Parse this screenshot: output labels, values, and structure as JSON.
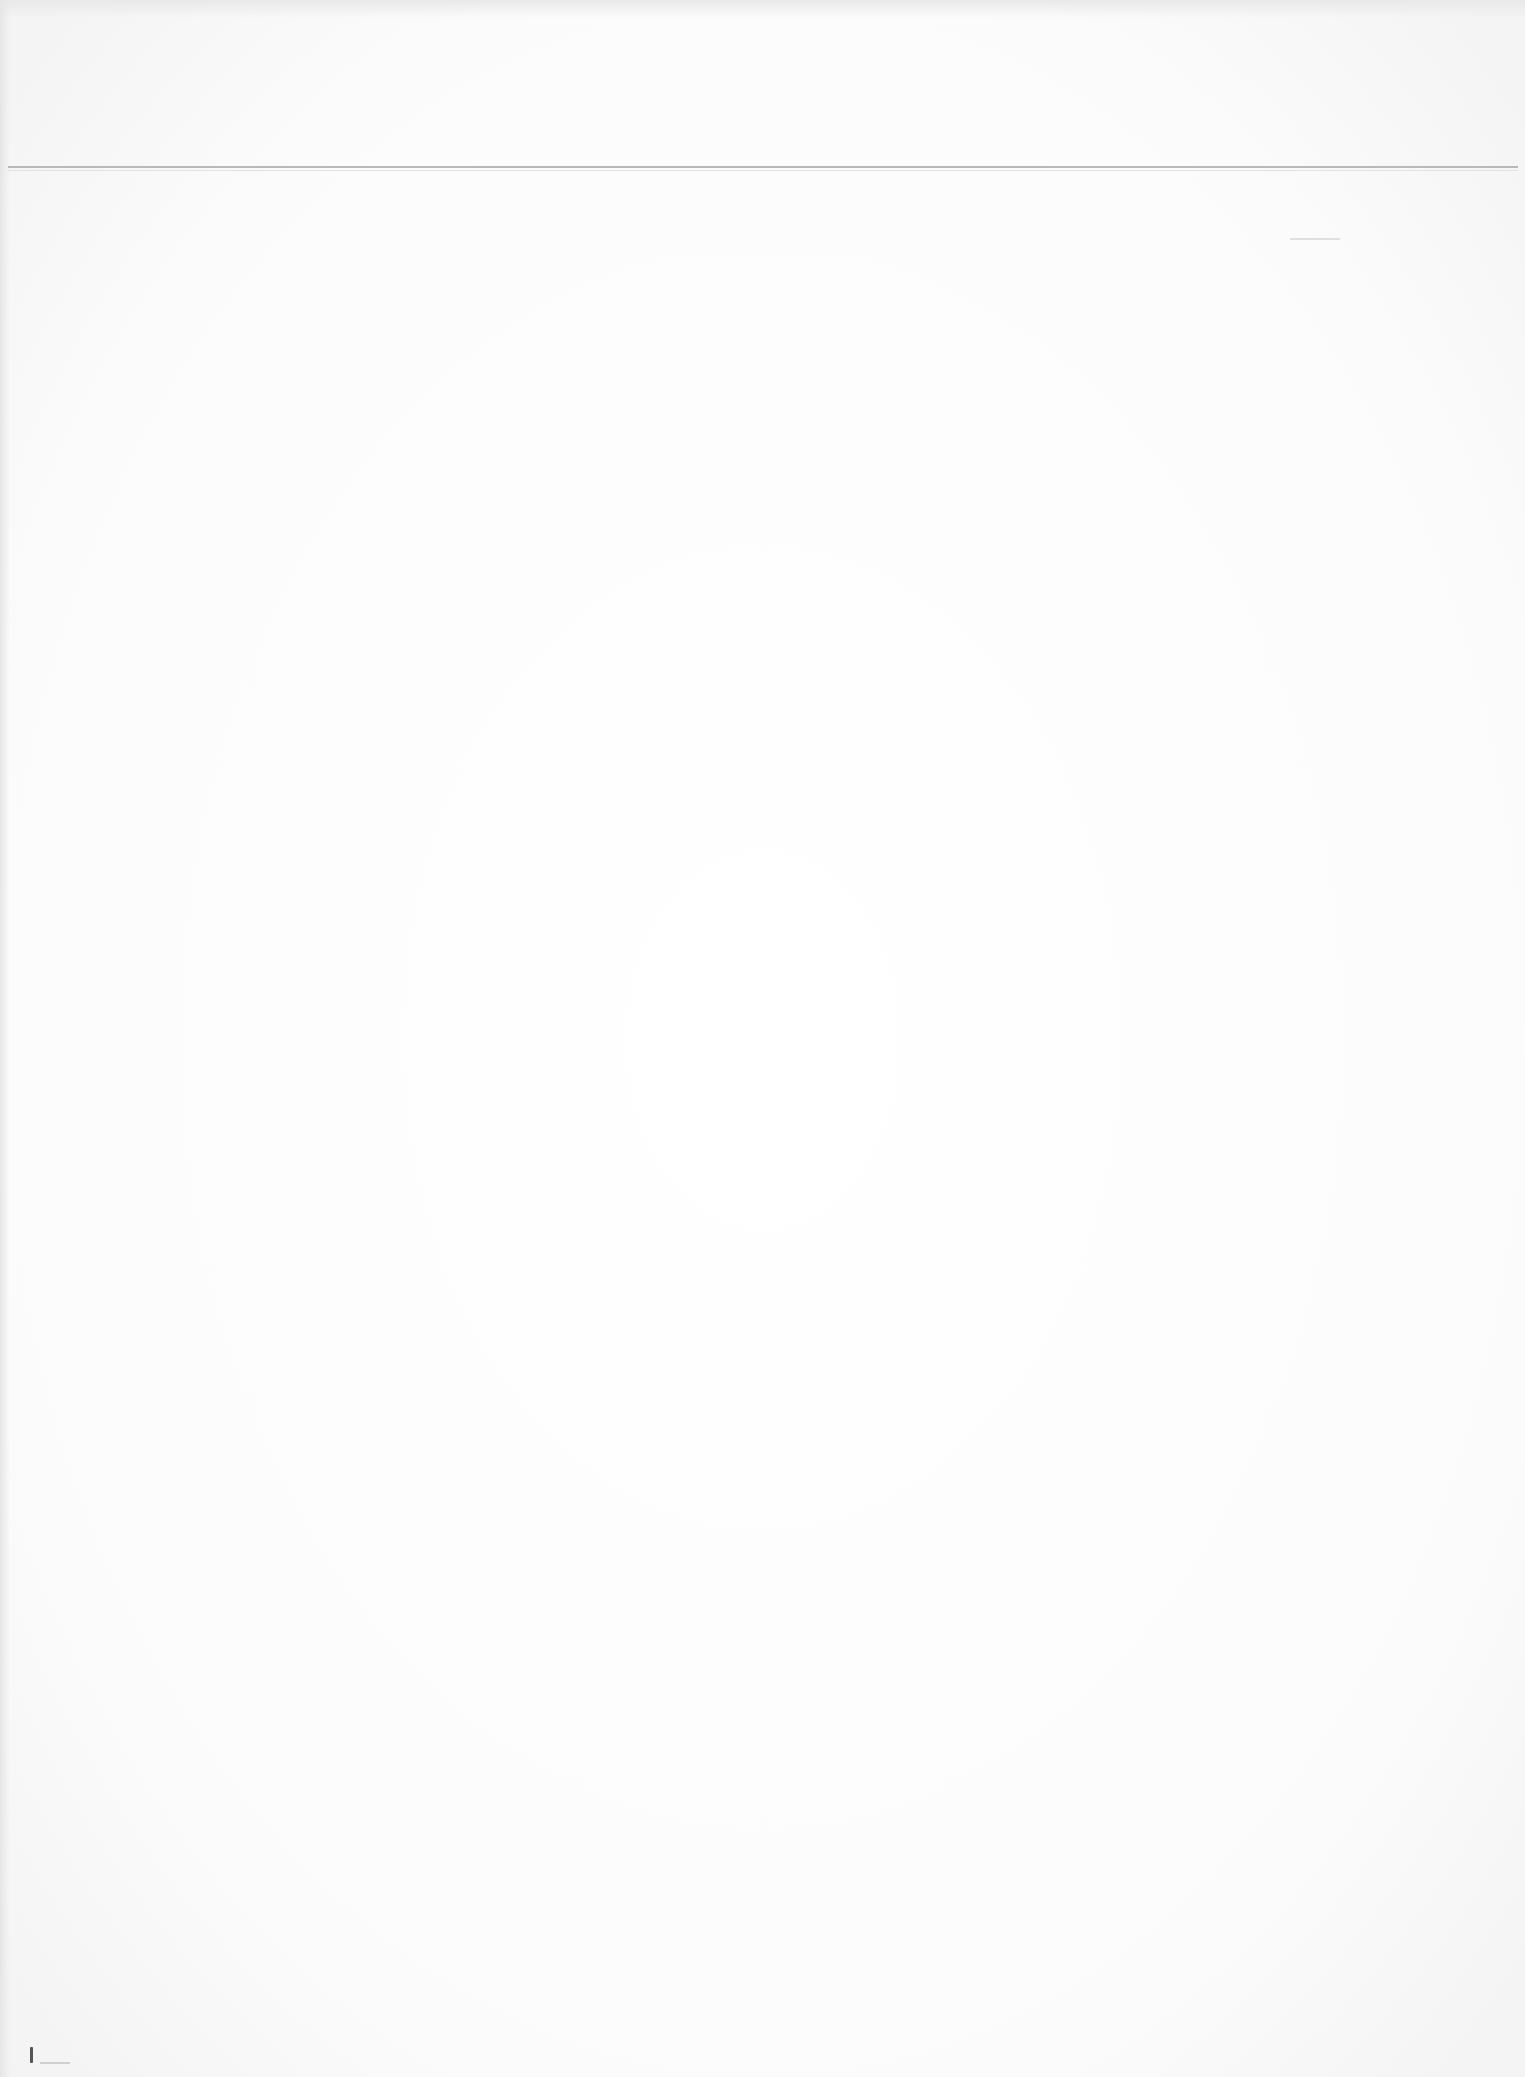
{
  "document": {
    "type": "scanned blank page",
    "visible_text": "",
    "elements": {
      "header_rule": "horizontal rule",
      "faint_mark": "faint dash",
      "scan_artifact": "speck"
    },
    "colors": {
      "paper": "#fbfbfb",
      "rule": "#b9b9b9",
      "artifact": "#555555"
    }
  }
}
